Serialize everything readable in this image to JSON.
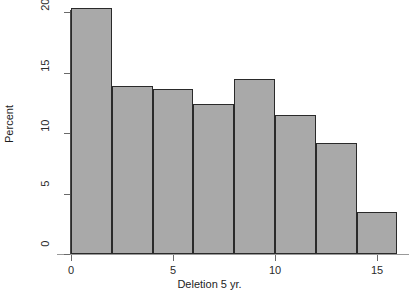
{
  "chart_data": {
    "type": "bar",
    "title": "",
    "xlabel": "Deletion 5 yr.",
    "ylabel": "Percent",
    "categories": [
      "0-2",
      "2-4",
      "4-6",
      "6-8",
      "8-10",
      "10-12",
      "12-14",
      "14-16"
    ],
    "bin_edges": [
      0,
      2,
      4,
      6,
      8,
      10,
      12,
      14,
      16
    ],
    "values": [
      20.3,
      13.9,
      13.6,
      12.4,
      14.5,
      11.5,
      9.2,
      3.5
    ],
    "bar_color": "#a9a9a9",
    "bar_edge_color": "#2a2a2a",
    "xlim": [
      -0.7,
      16.6
    ],
    "ylim": [
      0,
      20.9
    ],
    "x_ticks": [
      0,
      5,
      10,
      15
    ],
    "x_tick_labels": [
      "0",
      "5",
      "10",
      "15"
    ],
    "y_ticks": [
      0,
      5,
      10,
      15,
      20
    ],
    "y_tick_labels": [
      "0",
      "5",
      "10",
      "15",
      "20"
    ],
    "grid": false,
    "legend": "none"
  }
}
